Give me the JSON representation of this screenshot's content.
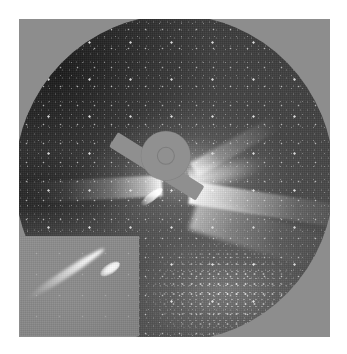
{
  "image": {
    "kind": "coronagraph-observation",
    "alt_text": "Grayscale coronagraph image of the solar corona with a bright comet and dense star field",
    "background_color": "#ffffff",
    "frame_color": "#8d8d8d"
  },
  "field_of_view": {
    "shape": "circular",
    "sky_color": "#3f3f3f",
    "corner_mask_color": "#8d8d8d"
  },
  "occulter": {
    "name": "occulting-disk",
    "color": "#909090",
    "sun_marker": {
      "name": "sun-position-circle",
      "stroke_color": "#787878"
    },
    "pylon": {
      "name": "occulter-support-pylon",
      "color": "#8f8f8f",
      "direction": "lower-left"
    }
  },
  "corona": {
    "streamers": [
      {
        "name": "streamer-north-east",
        "direction": "upper-right",
        "brightness": "bright"
      },
      {
        "name": "streamer-east",
        "direction": "right",
        "brightness": "brightest"
      },
      {
        "name": "streamer-south-east",
        "direction": "lower-right",
        "brightness": "faint"
      },
      {
        "name": "streamer-west",
        "direction": "left",
        "brightness": "bright"
      },
      {
        "name": "streamer-north",
        "direction": "up-right",
        "brightness": "faint"
      }
    ],
    "glow_color": "#e6e6e6"
  },
  "comet": {
    "name": "comet-streak",
    "position": "left-of-pylon",
    "color": "#ffffff",
    "orientation": "upper-right-to-lower-left"
  },
  "star_field": {
    "name": "milky-way-star-field",
    "dense_region": "lower-right",
    "star_color": "#ffffff"
  },
  "inset": {
    "name": "comet-magnified-inset",
    "position": "lower-left",
    "background_color": "#8a8a8a",
    "subject": "comet",
    "comet": {
      "nucleus_position": "upper-right",
      "tail_direction": "lower-left",
      "color": "#ffffff"
    }
  }
}
